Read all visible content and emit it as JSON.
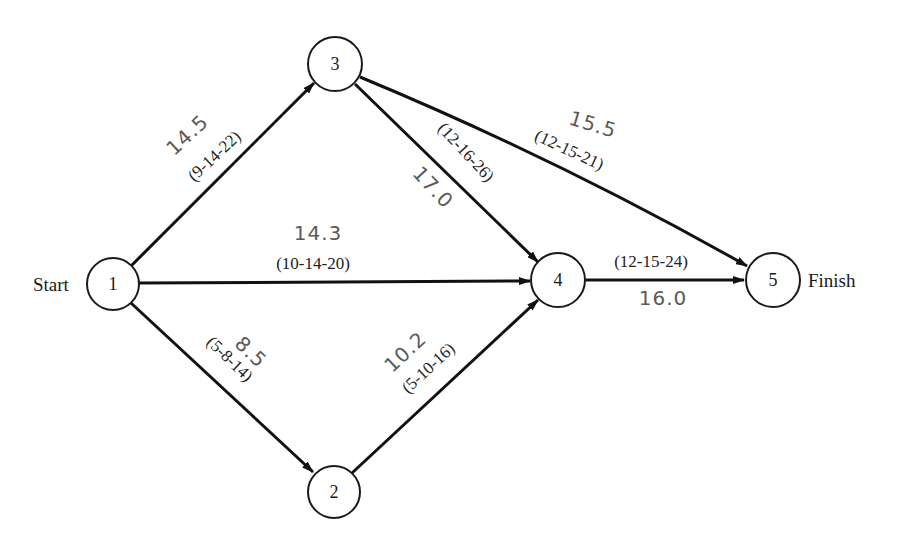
{
  "diagram": {
    "type": "PERT network",
    "start_label": "Start",
    "finish_label": "Finish",
    "nodes": [
      {
        "id": "1",
        "label": "1"
      },
      {
        "id": "2",
        "label": "2"
      },
      {
        "id": "3",
        "label": "3"
      },
      {
        "id": "4",
        "label": "4"
      },
      {
        "id": "5",
        "label": "5"
      }
    ],
    "edges": [
      {
        "from": "1",
        "to": "3",
        "estimates": "(9-14-22)",
        "expected": "14.5"
      },
      {
        "from": "1",
        "to": "4",
        "estimates": "(10-14-20)",
        "expected": "14.3"
      },
      {
        "from": "1",
        "to": "2",
        "estimates": "(5-8-14)",
        "expected": "8.5"
      },
      {
        "from": "3",
        "to": "4",
        "estimates": "(12-16-26)",
        "expected": "17.0"
      },
      {
        "from": "3",
        "to": "5",
        "estimates": "(12-15-21)",
        "expected": "15.5"
      },
      {
        "from": "2",
        "to": "4",
        "estimates": "(5-10-16)",
        "expected": "10.2"
      },
      {
        "from": "4",
        "to": "5",
        "estimates": "(12-15-24)",
        "expected": "16.0"
      }
    ]
  }
}
